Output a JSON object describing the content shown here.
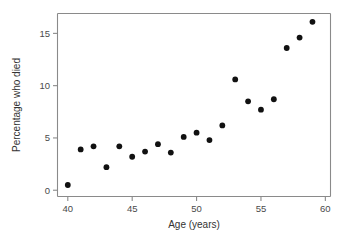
{
  "chart_data": {
    "type": "scatter",
    "title": "",
    "xlabel": "Age (years)",
    "ylabel": "Percentage who died",
    "xlim": [
      39.2,
      60.4
    ],
    "ylim": [
      -0.6,
      16.9
    ],
    "xticks": [
      40,
      45,
      50,
      55,
      60
    ],
    "yticks": [
      0,
      5,
      10,
      15
    ],
    "xtick_labels": [
      "40",
      "45",
      "50",
      "55",
      "60"
    ],
    "ytick_labels": [
      "0",
      "5",
      "10",
      "15"
    ],
    "grid": false,
    "legend": false,
    "marker": "circle",
    "marker_color": "#111111",
    "x": [
      40,
      41,
      42,
      43,
      44,
      45,
      46,
      47,
      48,
      49,
      50,
      51,
      52,
      53,
      54,
      55,
      56,
      57,
      58,
      59
    ],
    "y": [
      0.5,
      3.9,
      4.2,
      2.2,
      4.2,
      3.2,
      3.7,
      4.4,
      3.6,
      5.1,
      5.5,
      4.8,
      6.2,
      10.6,
      8.5,
      7.7,
      8.7,
      13.6,
      14.6,
      16.1
    ],
    "points": [
      {
        "x": 40,
        "y": 0.5
      },
      {
        "x": 41,
        "y": 3.9
      },
      {
        "x": 42,
        "y": 4.2
      },
      {
        "x": 43,
        "y": 2.2
      },
      {
        "x": 44,
        "y": 4.2
      },
      {
        "x": 45,
        "y": 3.2
      },
      {
        "x": 46,
        "y": 3.7
      },
      {
        "x": 47,
        "y": 4.4
      },
      {
        "x": 48,
        "y": 3.6
      },
      {
        "x": 49,
        "y": 5.1
      },
      {
        "x": 50,
        "y": 5.5
      },
      {
        "x": 51,
        "y": 4.8
      },
      {
        "x": 52,
        "y": 6.2
      },
      {
        "x": 53,
        "y": 10.6
      },
      {
        "x": 54,
        "y": 8.5
      },
      {
        "x": 55,
        "y": 7.7
      },
      {
        "x": 56,
        "y": 8.7
      },
      {
        "x": 57,
        "y": 13.6
      },
      {
        "x": 58,
        "y": 14.6
      },
      {
        "x": 59,
        "y": 16.1
      }
    ]
  },
  "colors": {
    "axis": "#8a8a8a",
    "tick_text": "#4a4a4a",
    "axis_title": "#333333",
    "marker": "#111111",
    "background": "#ffffff"
  }
}
